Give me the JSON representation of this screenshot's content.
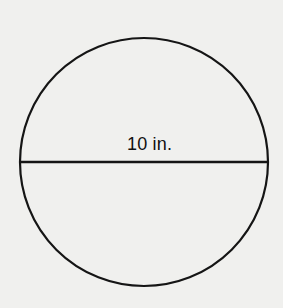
{
  "figure": {
    "shape": "circle",
    "diameter_label": "10 in.",
    "stroke_color": "#151515",
    "background_color": "#f0f0ee"
  }
}
